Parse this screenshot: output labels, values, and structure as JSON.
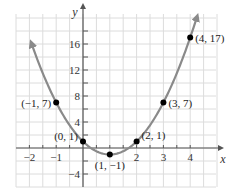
{
  "chart_data": {
    "type": "line",
    "title": "",
    "equation": "y = 2x^2 - 4x + 1",
    "xlabel": "x",
    "ylabel": "y",
    "xlim": [
      -2.5,
      5
    ],
    "ylim": [
      -6,
      20.5
    ],
    "grid": true,
    "legend": null,
    "x_ticks": [
      -2,
      -1,
      1,
      2,
      3,
      4
    ],
    "x_tick_labels": [
      "−2",
      "−1",
      "",
      "2",
      "3",
      "4"
    ],
    "y_ticks": [
      16,
      12,
      8,
      4,
      -4
    ],
    "y_tick_labels": [
      "16",
      "12",
      "8",
      "4",
      "−4"
    ],
    "series": [
      {
        "name": "parabola",
        "color": "#8a8a8a",
        "points": [
          {
            "x": -1,
            "y": 7,
            "label": "(−1, 7)"
          },
          {
            "x": 0,
            "y": 1,
            "label": "(0, 1)"
          },
          {
            "x": 1,
            "y": -1,
            "label": "(1, −1)"
          },
          {
            "x": 2,
            "y": 1,
            "label": "(2, 1)"
          },
          {
            "x": 3,
            "y": 7,
            "label": "(3, 7)"
          },
          {
            "x": 4,
            "y": 17,
            "label": "(4, 17)"
          }
        ]
      }
    ],
    "colors": {
      "curve": "#8a8a8a",
      "points": "#000000",
      "axis": "#555555",
      "grid": "#dcdcdc"
    }
  }
}
